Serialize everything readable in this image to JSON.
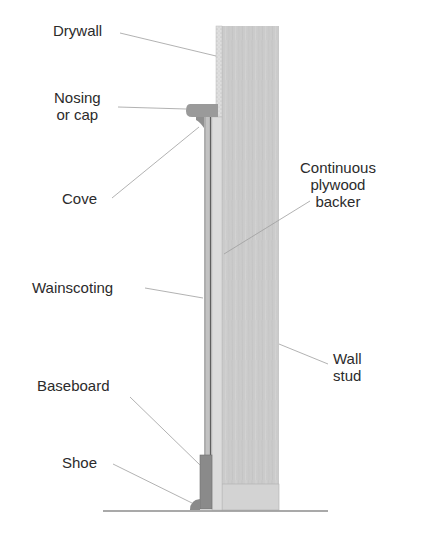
{
  "diagram": {
    "labels": {
      "drywall": "Drywall",
      "nosing_line1": "Nosing",
      "nosing_line2": "or cap",
      "cove": "Cove",
      "backer_line1": "Continuous",
      "backer_line2": "plywood",
      "backer_line3": "backer",
      "wainscoting": "Wainscoting",
      "wall_stud_line1": "Wall",
      "wall_stud_line2": "stud",
      "baseboard": "Baseboard",
      "shoe": "Shoe"
    },
    "colors": {
      "stud": "#c9c9c9",
      "drywall": "#d8d8d8",
      "cap": "#9a9a9a",
      "baseboard": "#8e8e8e",
      "leader": "#9e9e9e",
      "text": "#2b2b2b"
    }
  }
}
